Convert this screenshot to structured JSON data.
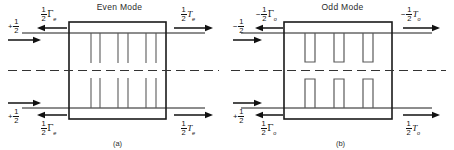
{
  "figure": {
    "panels": [
      {
        "id": "even",
        "title": "Even Mode",
        "caption": "(a)",
        "stub_style": "open-line",
        "labels": {
          "top_left_incident": {
            "sign": "+",
            "num": "1",
            "den": "2",
            "symbol": "",
            "subscript": ""
          },
          "top_left_reflected": {
            "sign": "",
            "num": "1",
            "den": "2",
            "symbol": "Γ",
            "subscript": "e"
          },
          "top_right_transmitted": {
            "sign": "",
            "num": "1",
            "den": "2",
            "symbol": "T",
            "subscript": "e"
          },
          "bottom_left_incident": {
            "sign": "+",
            "num": "1",
            "den": "2",
            "symbol": "",
            "subscript": ""
          },
          "bottom_left_reflected": {
            "sign": "",
            "num": "1",
            "den": "2",
            "symbol": "Γ",
            "subscript": "e"
          },
          "bottom_right_transmitted": {
            "sign": "",
            "num": "1",
            "den": "2",
            "symbol": "T",
            "subscript": "e"
          }
        }
      },
      {
        "id": "odd",
        "title": "Odd Mode",
        "caption": "(b)",
        "stub_style": "open-rect",
        "labels": {
          "top_left_incident": {
            "sign": "−",
            "num": "1",
            "den": "2",
            "symbol": "",
            "subscript": ""
          },
          "top_left_reflected": {
            "sign": "−",
            "num": "1",
            "den": "2",
            "symbol": "Γ",
            "subscript": "o"
          },
          "top_right_transmitted": {
            "sign": "−",
            "num": "1",
            "den": "2",
            "symbol": "T",
            "subscript": "o"
          },
          "bottom_left_incident": {
            "sign": "+",
            "num": "1",
            "den": "2",
            "symbol": "",
            "subscript": ""
          },
          "bottom_left_reflected": {
            "sign": "",
            "num": "1",
            "den": "2",
            "symbol": "Γ",
            "subscript": "o"
          },
          "bottom_right_transmitted": {
            "sign": "",
            "num": "1",
            "den": "2",
            "symbol": "T",
            "subscript": "o"
          }
        }
      }
    ],
    "colors": {
      "line": "#1a1a1a",
      "stub": "#555555",
      "background": "#ffffff"
    }
  }
}
